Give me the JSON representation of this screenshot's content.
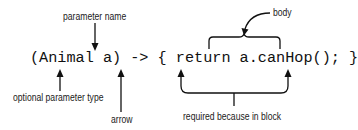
{
  "diagram": {
    "code": "(Animal a) -> { return a.canHop(); }",
    "labels": {
      "parameter_name": "parameter name",
      "body": "body",
      "optional_parameter_type": "optional parameter type",
      "arrow": "arrow",
      "required_because_in_block": "required because in block"
    },
    "colors": {
      "text": "#111111",
      "lines": "#111111",
      "background": "#ffffff"
    }
  }
}
